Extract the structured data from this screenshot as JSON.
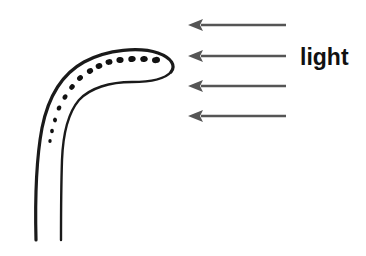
{
  "figure": {
    "type": "diagram",
    "background_color": "#ffffff",
    "width": 366,
    "height": 256
  },
  "labels": {
    "light": "light"
  },
  "colors": {
    "outline": "#1a1a1a",
    "dots": "#111111",
    "arrow": "#555555",
    "text": "#111111",
    "background": "#ffffff"
  },
  "plant": {
    "name": "coleoptile",
    "outer_outline_path": "M 36 240 C 35 200 36 160 42 128 C 48 98 62 74 84 62 C 108 49 140 47 158 53 C 172 58 176 66 171 72 C 165 79 150 82 132 82 C 110 82 90 88 79 100 C 68 113 63 134 62 160 C 61 190 61 218 61 240",
    "outer_edge_path": "M 36 240 C 35 200 36 160 42 128 C 48 98 62 74 84 62 C 108 49 140 47 158 53 C 172 58 176 66 171 72",
    "inner_edge_path": "M 61 240 C 61 218 61 190 62 160 C 63 134 68 113 79 100 C 90 88 110 82 132 82 C 150 82 165 79 171 72",
    "outer_stroke_width": 3.2,
    "inner_stroke_width": 2.4,
    "dots": [
      {
        "cx": 156,
        "cy": 60,
        "rx": 4.0,
        "ry": 3.1,
        "rot": -6
      },
      {
        "cx": 144,
        "cy": 59,
        "rx": 3.8,
        "ry": 3.0,
        "rot": -8
      },
      {
        "cx": 132,
        "cy": 59,
        "rx": 3.7,
        "ry": 3.0,
        "rot": -6
      },
      {
        "cx": 120,
        "cy": 60,
        "rx": 3.6,
        "ry": 2.9,
        "rot": -5
      },
      {
        "cx": 109,
        "cy": 62,
        "rx": 3.5,
        "ry": 2.9,
        "rot": -8
      },
      {
        "cx": 99,
        "cy": 66,
        "rx": 3.4,
        "ry": 2.8,
        "rot": -18
      },
      {
        "cx": 90,
        "cy": 71,
        "rx": 3.2,
        "ry": 2.7,
        "rot": -28
      },
      {
        "cx": 80,
        "cy": 78,
        "rx": 3.1,
        "ry": 2.6,
        "rot": -38
      },
      {
        "cx": 72,
        "cy": 87,
        "rx": 3.0,
        "ry": 2.5,
        "rot": -50
      },
      {
        "cx": 65,
        "cy": 97,
        "rx": 2.8,
        "ry": 2.3,
        "rot": -60
      },
      {
        "cx": 59,
        "cy": 108,
        "rx": 2.6,
        "ry": 2.2,
        "rot": -70
      },
      {
        "cx": 55,
        "cy": 120,
        "rx": 2.4,
        "ry": 2.0,
        "rot": -78
      },
      {
        "cx": 52,
        "cy": 131,
        "rx": 2.2,
        "ry": 1.9,
        "rot": -84
      },
      {
        "cx": 50,
        "cy": 141,
        "rx": 2.0,
        "ry": 1.7,
        "rot": -88
      }
    ]
  },
  "light_arrows": {
    "direction": "right-to-left",
    "count": 4,
    "tail_x": 286,
    "tip_x": 188,
    "shaft_width": 2.6,
    "head_length": 15,
    "head_half_height": 6,
    "rows": [
      {
        "y": 25
      },
      {
        "y": 56
      },
      {
        "y": 86
      },
      {
        "y": 116
      }
    ]
  }
}
